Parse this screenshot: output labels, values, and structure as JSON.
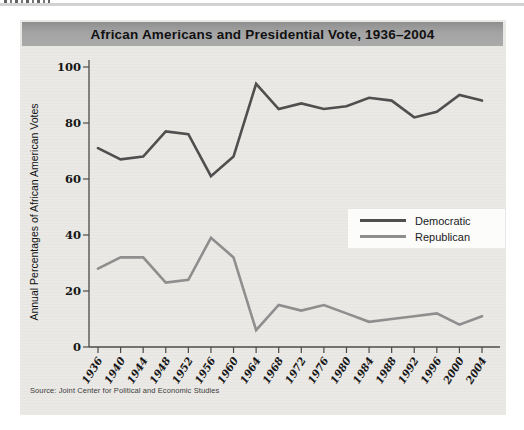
{
  "figure": {
    "source": "Source: Joint Center for Political and Economic Studies"
  },
  "chart_data": {
    "type": "line",
    "title": "African Americans and Presidential Vote, 1936–2004",
    "ylabel": "Annual Percentages of African American Votes",
    "xlabel": "",
    "categories": [
      "1936",
      "1940",
      "1944",
      "1948",
      "1952",
      "1956",
      "1960",
      "1964",
      "1968",
      "1972",
      "1976",
      "1980",
      "1984",
      "1988",
      "1992",
      "1996",
      "2000",
      "2004"
    ],
    "series": [
      {
        "name": "Democratic",
        "color": "#4f4f4f",
        "values": [
          71,
          67,
          68,
          77,
          76,
          61,
          68,
          94,
          85,
          87,
          85,
          86,
          89,
          88,
          82,
          84,
          90,
          88
        ]
      },
      {
        "name": "Republican",
        "color": "#8e8e8e",
        "values": [
          28,
          32,
          32,
          23,
          24,
          39,
          32,
          6,
          15,
          13,
          15,
          12,
          9,
          10,
          11,
          12,
          8,
          11
        ]
      }
    ],
    "ylim": [
      0,
      100
    ],
    "yticks": [
      0,
      20,
      40,
      60,
      80,
      100
    ],
    "grid": false,
    "legend_position": "center-right"
  }
}
